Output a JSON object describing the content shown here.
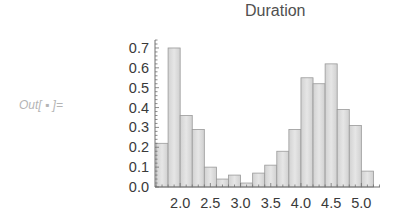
{
  "cell": {
    "out_label": "Out[ ▪ ]="
  },
  "chart_data": {
    "type": "bar",
    "title": "Duration",
    "xlabel": "",
    "ylabel": "",
    "bin_width": 0.2,
    "bin_edges": [
      1.6,
      1.8,
      2.0,
      2.2,
      2.4,
      2.6,
      2.8,
      3.0,
      3.2,
      3.4,
      3.6,
      3.8,
      4.0,
      4.2,
      4.4,
      4.6,
      4.8,
      5.0,
      5.2
    ],
    "categories": [
      "1.6-1.8",
      "1.8-2.0",
      "2.0-2.2",
      "2.2-2.4",
      "2.4-2.6",
      "2.6-2.8",
      "2.8-3.0",
      "3.0-3.2",
      "3.2-3.4",
      "3.4-3.6",
      "3.6-3.8",
      "3.8-4.0",
      "4.0-4.2",
      "4.2-4.4",
      "4.4-4.6",
      "4.6-4.8",
      "4.8-5.0",
      "5.0-5.2"
    ],
    "values": [
      0.22,
      0.7,
      0.36,
      0.29,
      0.1,
      0.04,
      0.06,
      0.02,
      0.07,
      0.11,
      0.18,
      0.29,
      0.55,
      0.52,
      0.62,
      0.39,
      0.31,
      0.08
    ],
    "x_ticks": [
      "2.0",
      "2.5",
      "3.0",
      "3.5",
      "4.0",
      "4.5",
      "5.0"
    ],
    "x_tick_values": [
      2.0,
      2.5,
      3.0,
      3.5,
      4.0,
      4.5,
      5.0
    ],
    "y_ticks": [
      "0.0",
      "0.1",
      "0.2",
      "0.3",
      "0.4",
      "0.5",
      "0.6",
      "0.7"
    ],
    "y_tick_values": [
      0.0,
      0.1,
      0.2,
      0.3,
      0.4,
      0.5,
      0.6,
      0.7
    ],
    "xlim": [
      1.6,
      5.3
    ],
    "ylim": [
      0,
      0.75
    ],
    "grid": false,
    "legend": null,
    "colors": {
      "bar_fill": "#dcdcdc",
      "bar_edge": "#9a9a9a",
      "axis": "#707070",
      "text": "#3a3a3a"
    }
  }
}
